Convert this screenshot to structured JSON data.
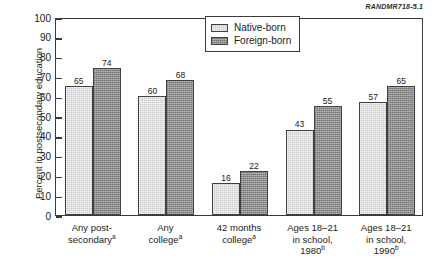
{
  "figure_id": "RANDMR718-5.1",
  "chart_data": {
    "type": "bar",
    "title": "",
    "xlabel": "",
    "ylabel": "Percent in postsecondary education",
    "ylim": [
      0,
      100
    ],
    "ytick_step": 10,
    "yticks": [
      100,
      90,
      80,
      70,
      60,
      50,
      40,
      30,
      20,
      10,
      0
    ],
    "grid": false,
    "legend_position": "top-right-inside",
    "categories": [
      "Any post-secondary",
      "Any college",
      "42 months college",
      "Ages 18–21 in school, 1980",
      "Ages 18–21 in school, 1990"
    ],
    "category_lines": [
      [
        "Any post-",
        "secondary",
        "a"
      ],
      [
        "Any",
        "college",
        "a"
      ],
      [
        "42 months",
        "college",
        "a"
      ],
      [
        "Ages 18–21",
        "in school,",
        "1980",
        "b"
      ],
      [
        "Ages 18–21",
        "in school,",
        "1990",
        "b"
      ]
    ],
    "series": [
      {
        "name": "Native-born",
        "color": "#c9c9c9",
        "values": [
          65,
          60,
          16,
          43,
          57
        ]
      },
      {
        "name": "Foreign-born",
        "color": "#8e8e8e",
        "values": [
          74,
          68,
          22,
          55,
          65
        ]
      }
    ]
  },
  "legend": {
    "items": [
      {
        "label": "Native-born"
      },
      {
        "label": "Foreign-born"
      }
    ]
  }
}
